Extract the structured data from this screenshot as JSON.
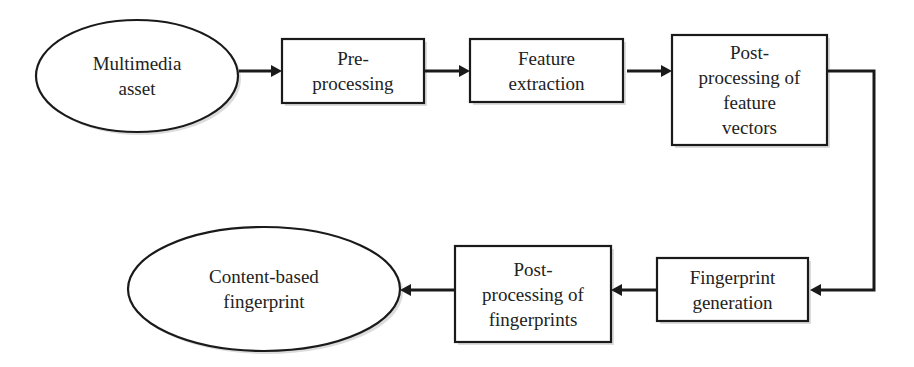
{
  "diagram": {
    "type": "flowchart",
    "nodes": [
      {
        "id": "multimedia-asset",
        "shape": "ellipse",
        "label": "Multimedia\nasset"
      },
      {
        "id": "pre-processing",
        "shape": "rect",
        "label": "Pre-\nprocessing"
      },
      {
        "id": "feature-extraction",
        "shape": "rect",
        "label": "Feature\nextraction"
      },
      {
        "id": "post-processing-feature-vectors",
        "shape": "rect",
        "label": "Post-\nprocessing of\nfeature\nvectors"
      },
      {
        "id": "fingerprint-generation",
        "shape": "rect",
        "label": "Fingerprint\ngeneration"
      },
      {
        "id": "post-processing-fingerprints",
        "shape": "rect",
        "label": "Post-\nprocessing of\nfingerprints"
      },
      {
        "id": "content-based-fingerprint",
        "shape": "ellipse",
        "label": "Content-based\nfingerprint"
      }
    ],
    "edges": [
      {
        "from": "multimedia-asset",
        "to": "pre-processing"
      },
      {
        "from": "pre-processing",
        "to": "feature-extraction"
      },
      {
        "from": "feature-extraction",
        "to": "post-processing-feature-vectors"
      },
      {
        "from": "post-processing-feature-vectors",
        "to": "fingerprint-generation"
      },
      {
        "from": "fingerprint-generation",
        "to": "post-processing-fingerprints"
      },
      {
        "from": "post-processing-fingerprints",
        "to": "content-based-fingerprint"
      }
    ]
  }
}
